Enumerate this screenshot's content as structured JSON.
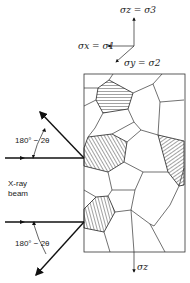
{
  "figure": {
    "type": "x-ray diffraction stress measurement schematic",
    "stress_axes": {
      "z_label": "σz = σ3",
      "x_label": "σx = σ1",
      "y_label": "σy = σ2"
    },
    "bottom_stress_label": "σz",
    "beam_label_line1": "X-ray",
    "beam_label_line2": "beam",
    "angle_label_upper": "180° − 2θ",
    "angle_label_lower": "180° − 2θ"
  },
  "colors": {
    "line": "#333333",
    "background": "#ffffff"
  }
}
